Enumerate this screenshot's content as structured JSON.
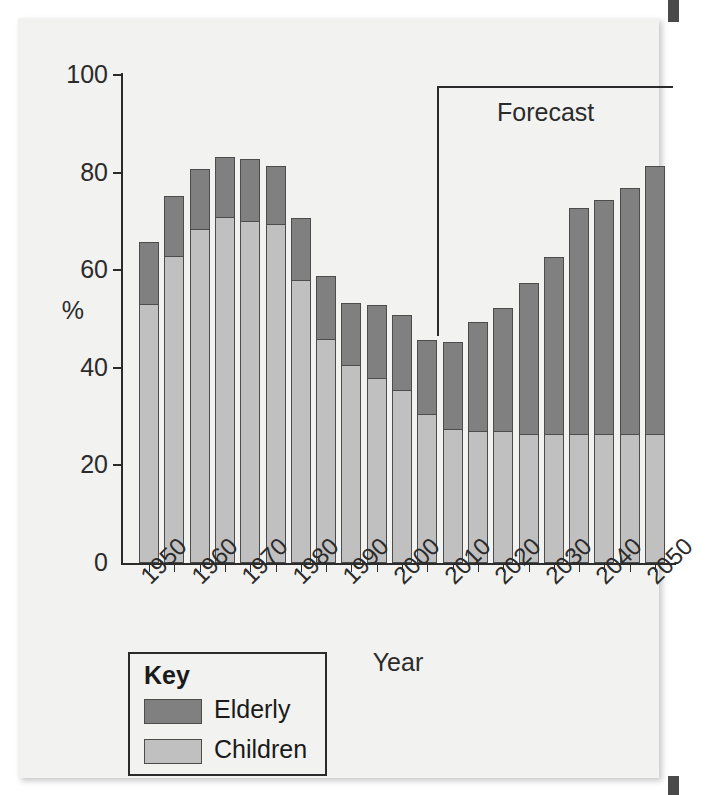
{
  "axis_title_y": "%",
  "axis_title_x": "Year",
  "forecast_label": "Forecast",
  "legend": {
    "title": "Key",
    "items": [
      {
        "label": "Elderly",
        "color": "#808080"
      },
      {
        "label": "Children",
        "color": "#c0c0c0"
      }
    ]
  },
  "y_ticks": [
    "0",
    "20",
    "40",
    "60",
    "80",
    "100"
  ],
  "x_tick_labels": [
    "1950",
    "1960",
    "1970",
    "1980",
    "1990",
    "2000",
    "2010",
    "2020",
    "2030",
    "2040",
    "2050"
  ],
  "chart_data": {
    "type": "bar",
    "title": "",
    "subtitle": "",
    "xlabel": "Year",
    "ylabel": "%",
    "ylim": [
      0,
      100
    ],
    "ytick_values": [
      0,
      20,
      40,
      60,
      80,
      100
    ],
    "grid": false,
    "stacked": true,
    "legend_position": "below-left",
    "legend_title": "Key",
    "annotations": [
      {
        "text": "Forecast",
        "from_x": "2010",
        "to_x": "2050",
        "note": "bracket spanning forecast years"
      }
    ],
    "categories": [
      "1950",
      "1955",
      "1960",
      "1965",
      "1970",
      "1975",
      "1980",
      "1985",
      "1990",
      "1995",
      "2000",
      "2005",
      "2010",
      "2015",
      "2020",
      "2025",
      "2030",
      "2035",
      "2040",
      "2045",
      "2050"
    ],
    "labeled_categories": [
      "1950",
      "1960",
      "1970",
      "1980",
      "1990",
      "2000",
      "2010",
      "2020",
      "2030",
      "2040",
      "2050"
    ],
    "series": [
      {
        "name": "Children",
        "color": "#c0c0c0",
        "values": [
          53,
          63,
          68.5,
          71,
          70,
          69.5,
          58,
          46,
          40.5,
          38,
          35.5,
          30.5,
          27.5,
          27,
          27,
          26.5,
          26.5,
          26.5,
          26.5,
          26.5,
          26.5
        ]
      },
      {
        "name": "Elderly",
        "color": "#808080",
        "values": [
          13,
          12.5,
          12.5,
          12.5,
          13,
          12,
          13,
          13,
          13,
          15,
          15.5,
          15.5,
          18,
          22.5,
          25.5,
          31,
          36.5,
          46.5,
          48,
          50.5,
          55
        ]
      }
    ],
    "totals": [
      66,
      75.5,
      81,
      83.5,
      83,
      81.5,
      71,
      59,
      53.5,
      53,
      51,
      46,
      45.5,
      49.5,
      52.5,
      57.5,
      66,
      73,
      74.5,
      77,
      81.5
    ]
  }
}
